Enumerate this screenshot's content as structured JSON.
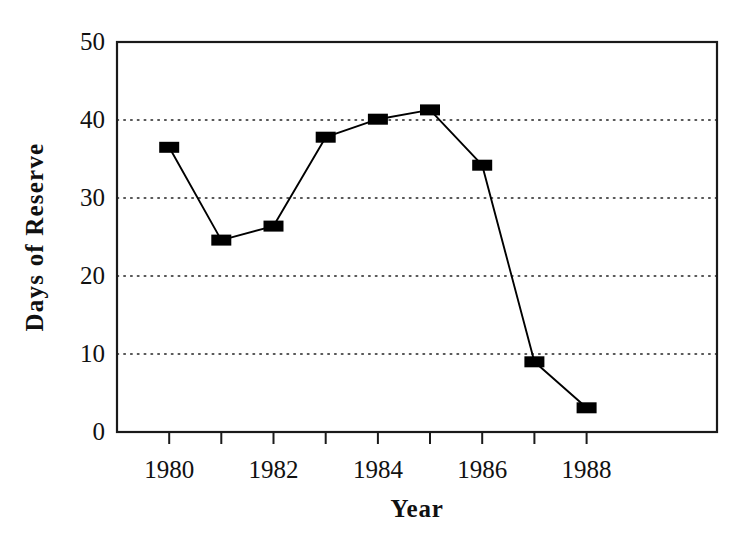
{
  "chart_data": {
    "type": "line",
    "title": "",
    "subtitle": "",
    "xlabel": "Year",
    "ylabel": "Days of Reserve",
    "x": [
      1980,
      1981,
      1982,
      1983,
      1984,
      1985,
      1986,
      1987,
      1988
    ],
    "values": [
      36.5,
      24.6,
      26.4,
      37.8,
      40.1,
      41.3,
      34.2,
      9.0,
      3.1
    ],
    "series": [
      {
        "name": "Days of Reserve",
        "x": [
          1980,
          1981,
          1982,
          1983,
          1984,
          1985,
          1986,
          1987,
          1988
        ],
        "values": [
          36.5,
          24.6,
          26.4,
          37.8,
          40.1,
          41.3,
          34.2,
          9.0,
          3.1
        ]
      }
    ],
    "xlim": [
      1979.0,
      1990.5
    ],
    "ylim": [
      0,
      50
    ],
    "ytick_values": [
      0,
      10,
      20,
      30,
      40,
      50
    ],
    "ytick_labels": [
      "0",
      "10",
      "20",
      "30",
      "40",
      "50"
    ],
    "xtick_values": [
      1980,
      1981,
      1982,
      1983,
      1984,
      1985,
      1986,
      1987,
      1988
    ],
    "xtick_labels": [
      "1980",
      "",
      "1982",
      "",
      "1984",
      "",
      "1986",
      "",
      "1988"
    ],
    "xtick_labels_shown": [
      "1980",
      "1982",
      "1984",
      "1986",
      "1988"
    ],
    "grid": "horizontal-dotted",
    "grid_values": [
      10,
      20,
      30,
      40
    ],
    "legend": "none",
    "marker": "square",
    "marker_color": "#000000",
    "line_color": "#000000",
    "background_color": "#ffffff",
    "axis_color": "#1a1a1a"
  }
}
